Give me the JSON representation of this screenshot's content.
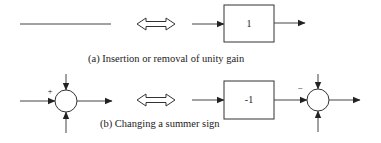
{
  "diagram": {
    "panel_a": {
      "caption": "(a) Insertion or removal of unity gain",
      "left": {
        "type": "plain-line"
      },
      "equivalence": "double-arrow",
      "right": {
        "type": "gain-block",
        "gain_label": "1"
      }
    },
    "panel_b": {
      "caption": "(b) Changing a summer sign",
      "left": {
        "type": "summer",
        "sign_label": "+"
      },
      "equivalence": "double-arrow",
      "right": {
        "type": "gain-block-then-summer",
        "gain_label": "-1",
        "sign_label": "−"
      }
    },
    "colors": {
      "stroke": "#222222",
      "background": "#ffffff"
    }
  }
}
